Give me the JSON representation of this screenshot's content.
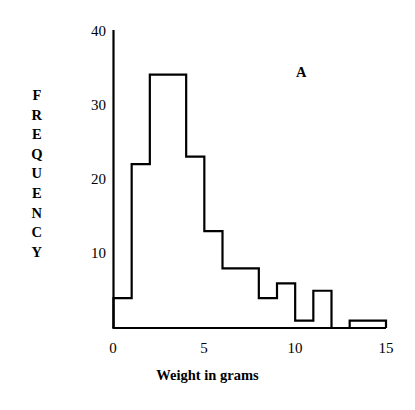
{
  "figure": {
    "panel_tag": "A",
    "y_axis_title_letters": [
      "F",
      "R",
      "E",
      "Q",
      "U",
      "E",
      "N",
      "C",
      "Y"
    ],
    "y_axis_title": "FREQUENCY",
    "x_axis_title": "Weight in grams",
    "line_color": "#000000",
    "background_color": "#ffffff"
  },
  "chart_data": {
    "type": "bar",
    "title": "",
    "subtitle": "",
    "annotations": [
      "A"
    ],
    "xlabel": "Weight in grams",
    "ylabel": "FREQUENCY",
    "style": "histogram",
    "bin_width": 1,
    "bin_edges": [
      0,
      1,
      2,
      3,
      4,
      5,
      6,
      7,
      8,
      9,
      10,
      11,
      12,
      13,
      14,
      15
    ],
    "categories": [
      "0-1",
      "1-2",
      "2-3",
      "3-4",
      "4-5",
      "5-6",
      "6-7",
      "7-8",
      "8-9",
      "9-10",
      "10-11",
      "11-12",
      "12-13",
      "13-14",
      "14-15"
    ],
    "values": [
      4,
      22,
      34,
      34,
      23,
      13,
      8,
      8,
      4,
      6,
      1,
      5,
      0,
      1,
      1
    ],
    "xlim": [
      0,
      15
    ],
    "ylim": [
      0,
      40
    ],
    "xticks": [
      0,
      5,
      10,
      15
    ],
    "xtick_labels": [
      "0",
      "5",
      "10",
      "15"
    ],
    "yticks": [
      10,
      20,
      30,
      40
    ],
    "ytick_labels": [
      "10",
      "20",
      "30",
      "40"
    ],
    "grid": false,
    "legend": false,
    "legend_position": "none",
    "fill": "none"
  },
  "axes": {
    "y_ticks": [
      {
        "label": "40",
        "value": 40
      },
      {
        "label": "30",
        "value": 30
      },
      {
        "label": "20",
        "value": 20
      },
      {
        "label": "10",
        "value": 10
      }
    ],
    "x_ticks": [
      {
        "label": "0",
        "value": 0
      },
      {
        "label": "5",
        "value": 5
      },
      {
        "label": "10",
        "value": 10
      },
      {
        "label": "15",
        "value": 15
      }
    ]
  }
}
